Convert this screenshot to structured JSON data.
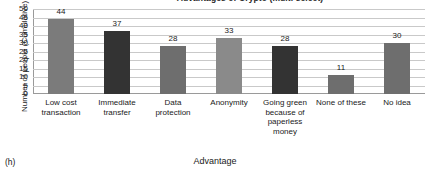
{
  "panel_tag": "(h)",
  "chart_data": {
    "type": "bar",
    "title": "Advantages of Crypto (multi select)",
    "xlabel": "Advantage",
    "ylabel": "Number of people (Cumulative)",
    "ylim": [
      0,
      50
    ],
    "ytick_step": 5,
    "yticks": [
      50,
      45,
      40,
      35,
      30,
      25,
      20,
      15,
      10,
      5,
      0
    ],
    "grid": true,
    "legend": "none",
    "categories": [
      "Low cost transaction",
      "Immediate transfer",
      "Data protection",
      "Anonymity",
      "Going green because of paperless money",
      "None of these",
      "No idea"
    ],
    "category_lines": [
      [
        "Low cost",
        "transaction"
      ],
      [
        "Immediate",
        "transfer"
      ],
      [
        "Data",
        "protection"
      ],
      [
        "Anonymity"
      ],
      [
        "Going green",
        "because of",
        "paperless",
        "money"
      ],
      [
        "None of these"
      ],
      [
        "No idea"
      ]
    ],
    "values": [
      44,
      37,
      28,
      33,
      28,
      11,
      30
    ],
    "bar_colors": [
      "#7b7b7b",
      "#333333",
      "#6e6e6e",
      "#8a8a8a",
      "#333333",
      "#6e6e6e",
      "#6e6e6e"
    ]
  }
}
